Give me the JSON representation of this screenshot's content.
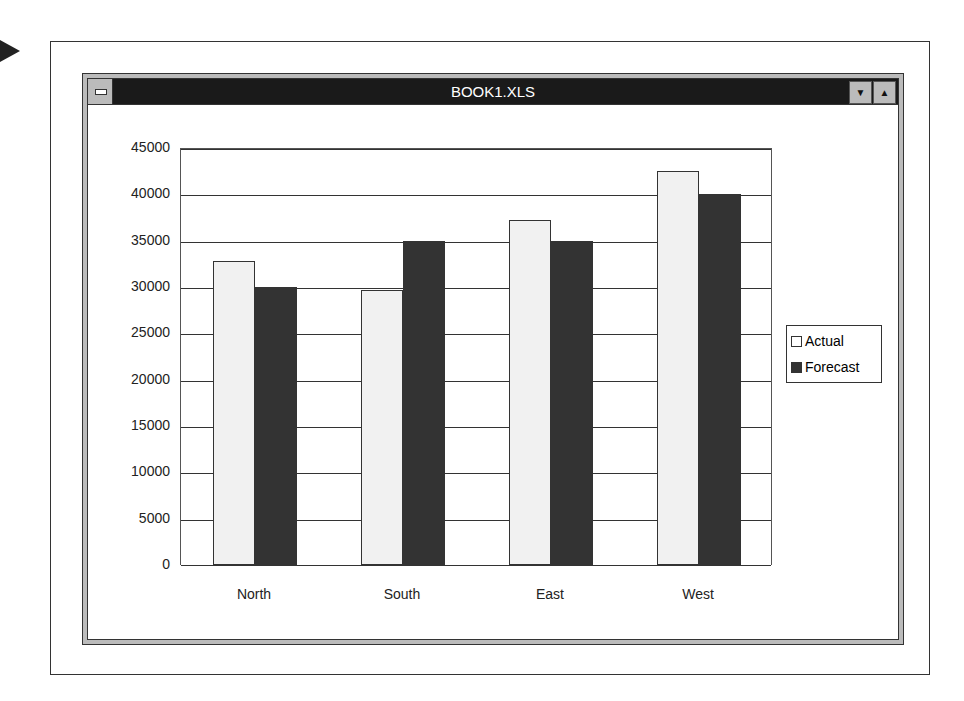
{
  "window": {
    "title": "BOOK1.XLS",
    "min_icon": "down-arrow",
    "max_icon": "up-arrow",
    "system_icon": "system-menu"
  },
  "colors": {
    "actual": "#f1f1f1",
    "forecast": "#333333",
    "titlebar": "#1a1a1a"
  },
  "chart_data": {
    "type": "bar",
    "title": "",
    "categories": [
      "North",
      "South",
      "East",
      "West"
    ],
    "series": [
      {
        "name": "Actual",
        "values": [
          32800,
          29700,
          37200,
          42500
        ]
      },
      {
        "name": "Forecast",
        "values": [
          30000,
          35000,
          35000,
          40000
        ]
      }
    ],
    "xlabel": "",
    "ylabel": "",
    "ylim": [
      0,
      45000
    ],
    "yticks": [
      "0",
      "5000",
      "10000",
      "15000",
      "20000",
      "25000",
      "30000",
      "35000",
      "40000",
      "45000"
    ],
    "grid": true,
    "legend_position": "right"
  }
}
